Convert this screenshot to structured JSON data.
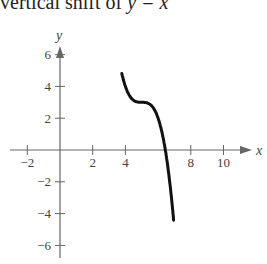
{
  "caption": {
    "prefix": "vertical shift of ",
    "var": "y",
    "rest": " = x"
  },
  "chart_data": {
    "type": "line",
    "title": "",
    "xlabel": "x",
    "ylabel": "y",
    "xlim": [
      -3,
      12
    ],
    "ylim": [
      -7,
      7
    ],
    "x_ticks": [
      -2,
      2,
      4,
      8,
      10
    ],
    "y_ticks": [
      6,
      4,
      2,
      -2,
      -4,
      -6
    ],
    "grid": false,
    "series": [
      {
        "name": "y = -(x - 5)^3 + 3",
        "x": [
          3.8,
          4.0,
          4.3,
          4.6,
          5.0,
          5.3,
          5.6,
          6.0,
          6.3,
          6.6,
          7.0
        ],
        "y": [
          6.7,
          4.0,
          3.34,
          3.06,
          3.0,
          2.97,
          2.78,
          2.0,
          0.8,
          -1.1,
          -5.0
        ]
      }
    ],
    "colors": {
      "axis": "#666666",
      "curve": "#111111",
      "text": "#444444"
    }
  }
}
